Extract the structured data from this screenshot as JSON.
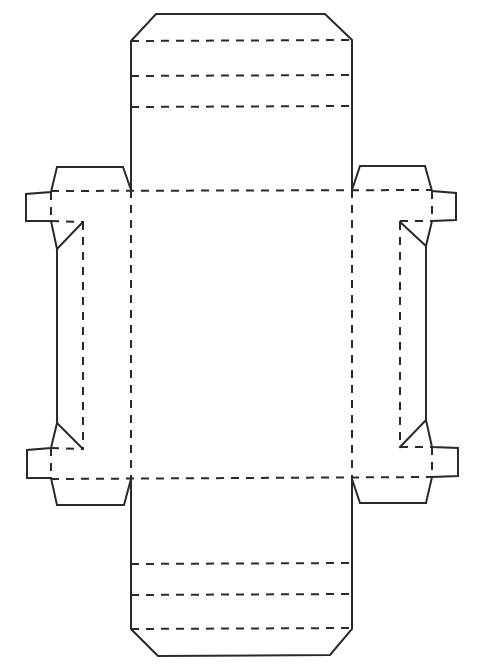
{
  "diagram": {
    "type": "box-net-dieline",
    "colors": {
      "line": "#2a2a2a",
      "background": "#ffffff"
    },
    "legend": {
      "solid": "cut line",
      "dashed": "fold line"
    },
    "cut_paths": [
      {
        "name": "top-panel-outline",
        "points": "131,190 131,41 156,14 325,14 352,40 352,190"
      },
      {
        "name": "bottom-panel-outline",
        "points": "131,479 131,629 158,656 330,655 352,629 352,479"
      },
      {
        "name": "left-upper-flap",
        "points": "131,190 123,167 57,167 51,192 26,194 26,221 51,221 57,249 83,222"
      },
      {
        "name": "left-side-edge",
        "points": "57,249 57,423"
      },
      {
        "name": "left-lower-flap",
        "points": "83,449 57,423 51,448 27,450 27,478 51,478 57,505 124,505 131,479"
      },
      {
        "name": "right-upper-flap",
        "points": "352,190 360,166 425,166 432,191 456,193 456,220 432,221 426,246 400,222"
      },
      {
        "name": "right-side-edge",
        "points": "426,246 426,420"
      },
      {
        "name": "right-lower-flap",
        "points": "400,447 426,420 432,447 458,448 458,476 432,477 426,503 360,503 352,479"
      }
    ],
    "fold_lines": [
      {
        "name": "top-fold-1",
        "x1": 131,
        "y1": 41,
        "x2": 352,
        "y2": 40
      },
      {
        "name": "top-fold-2",
        "x1": 131,
        "y1": 76,
        "x2": 352,
        "y2": 75
      },
      {
        "name": "top-fold-3",
        "x1": 131,
        "y1": 107,
        "x2": 352,
        "y2": 106
      },
      {
        "name": "main-top-fold",
        "x1": 51,
        "y1": 191,
        "x2": 432,
        "y2": 190
      },
      {
        "name": "main-bottom-fold",
        "x1": 51,
        "y1": 479,
        "x2": 432,
        "y2": 477
      },
      {
        "name": "main-left-fold",
        "x1": 131,
        "y1": 190,
        "x2": 131,
        "y2": 479
      },
      {
        "name": "main-right-fold",
        "x1": 352,
        "y1": 190,
        "x2": 352,
        "y2": 479
      },
      {
        "name": "left-tab-fold-upper",
        "x1": 51,
        "y1": 192,
        "x2": 51,
        "y2": 221
      },
      {
        "name": "left-tab-fold-lower",
        "x1": 51,
        "y1": 448,
        "x2": 51,
        "y2": 478
      },
      {
        "name": "left-inner-fold",
        "x1": 83,
        "y1": 222,
        "x2": 83,
        "y2": 449
      },
      {
        "name": "left-upper-inner",
        "x1": 51,
        "y1": 221,
        "x2": 83,
        "y2": 222
      },
      {
        "name": "left-lower-inner",
        "x1": 51,
        "y1": 448,
        "x2": 83,
        "y2": 449
      },
      {
        "name": "right-tab-fold-upper",
        "x1": 432,
        "y1": 191,
        "x2": 432,
        "y2": 221
      },
      {
        "name": "right-tab-fold-lower",
        "x1": 432,
        "y1": 447,
        "x2": 432,
        "y2": 477
      },
      {
        "name": "right-inner-fold",
        "x1": 400,
        "y1": 222,
        "x2": 400,
        "y2": 447
      },
      {
        "name": "right-upper-inner",
        "x1": 400,
        "y1": 221,
        "x2": 432,
        "y2": 221
      },
      {
        "name": "right-lower-inner",
        "x1": 400,
        "y1": 447,
        "x2": 432,
        "y2": 447
      },
      {
        "name": "bottom-fold-1",
        "x1": 131,
        "y1": 564,
        "x2": 352,
        "y2": 563
      },
      {
        "name": "bottom-fold-2",
        "x1": 131,
        "y1": 595,
        "x2": 352,
        "y2": 594
      },
      {
        "name": "bottom-fold-3",
        "x1": 131,
        "y1": 629,
        "x2": 352,
        "y2": 628
      }
    ]
  }
}
